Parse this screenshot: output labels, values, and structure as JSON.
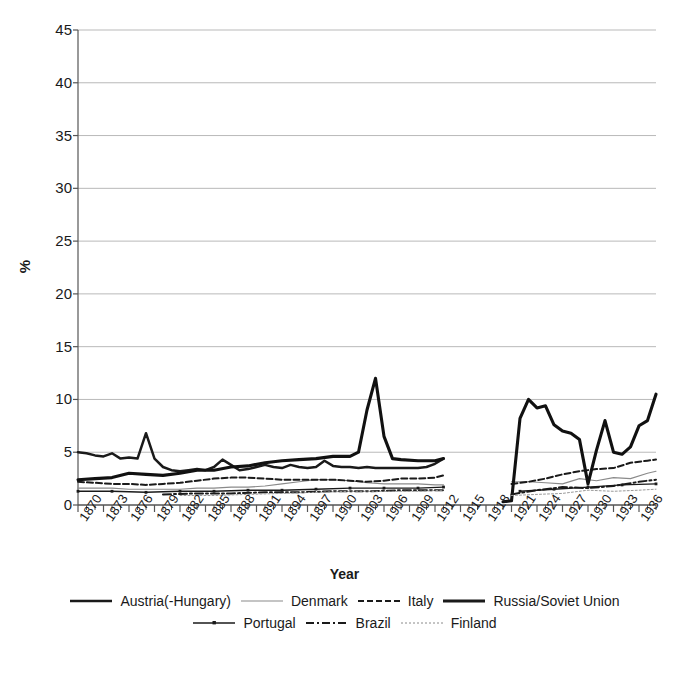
{
  "chart_data": {
    "type": "line",
    "title": "",
    "xlabel": "Year",
    "ylabel": "%",
    "ylim": [
      0,
      45
    ],
    "ytick_step": 5,
    "yticks": [
      45,
      40,
      35,
      30,
      25,
      20,
      15,
      10,
      5,
      0
    ],
    "xlim": [
      1870,
      1938
    ],
    "xtick_labels": [
      "1870",
      "1873",
      "1876",
      "1879",
      "1882",
      "1885",
      "1888",
      "1891",
      "1894",
      "1897",
      "1900",
      "1903",
      "1906",
      "1909",
      "1912",
      "1915",
      "1918",
      "1921",
      "1924",
      "1927",
      "1930",
      "1933",
      "1936"
    ],
    "xtick_step": 3,
    "minor_xtick_step": 1,
    "grid": "horizontal",
    "legend_position": "bottom",
    "series": [
      {
        "name": "Austria(-Hungary)",
        "style": "solid-thick",
        "color": "#1a1a1a",
        "x": [
          1870,
          1871,
          1872,
          1873,
          1874,
          1875,
          1876,
          1877,
          1878,
          1879,
          1880,
          1881,
          1882,
          1883,
          1884,
          1885,
          1886,
          1887,
          1888,
          1889,
          1890,
          1891,
          1892,
          1893,
          1894,
          1895,
          1896,
          1897,
          1898,
          1899,
          1900,
          1901,
          1902,
          1903,
          1904,
          1905,
          1906,
          1907,
          1908,
          1909,
          1910,
          1911,
          1912,
          1913
        ],
        "values": [
          5.0,
          4.9,
          4.7,
          4.6,
          4.9,
          4.4,
          4.5,
          4.4,
          6.8,
          4.4,
          3.6,
          3.3,
          3.2,
          3.3,
          3.4,
          3.3,
          3.6,
          4.3,
          3.8,
          3.3,
          3.4,
          3.6,
          3.8,
          3.6,
          3.5,
          3.8,
          3.6,
          3.5,
          3.6,
          4.2,
          3.7,
          3.6,
          3.6,
          3.5,
          3.6,
          3.5,
          3.5,
          3.5,
          3.5,
          3.5,
          3.5,
          3.6,
          3.9,
          4.4
        ]
      },
      {
        "name": "Denmark",
        "style": "solid-thin",
        "color": "#8a8a8a",
        "x": [
          1870,
          1872,
          1874,
          1876,
          1878,
          1880,
          1882,
          1884,
          1886,
          1888,
          1890,
          1892,
          1894,
          1896,
          1898,
          1900,
          1902,
          1904,
          1906,
          1908,
          1910,
          1912,
          1913,
          1921,
          1923,
          1925,
          1927,
          1929,
          1931,
          1933,
          1935,
          1937,
          1938
        ],
        "values": [
          1.6,
          1.6,
          1.6,
          1.5,
          1.5,
          1.5,
          1.5,
          1.6,
          1.6,
          1.7,
          1.7,
          1.8,
          2.0,
          2.2,
          2.4,
          2.4,
          2.3,
          2.1,
          2.0,
          2.0,
          2.0,
          1.9,
          1.9,
          2.2,
          2.2,
          2.1,
          2.0,
          2.5,
          2.3,
          2.6,
          2.5,
          3.0,
          3.2
        ]
      },
      {
        "name": "Italy",
        "style": "dashed",
        "color": "#1a1a1a",
        "x": [
          1870,
          1872,
          1874,
          1876,
          1878,
          1880,
          1882,
          1884,
          1886,
          1888,
          1890,
          1892,
          1894,
          1896,
          1898,
          1900,
          1902,
          1904,
          1906,
          1908,
          1910,
          1912,
          1913,
          1921,
          1923,
          1925,
          1927,
          1929,
          1931,
          1933,
          1935,
          1937,
          1938
        ],
        "values": [
          2.2,
          2.1,
          2.0,
          2.0,
          1.9,
          2.0,
          2.1,
          2.3,
          2.5,
          2.6,
          2.6,
          2.5,
          2.4,
          2.4,
          2.4,
          2.4,
          2.3,
          2.2,
          2.3,
          2.5,
          2.5,
          2.6,
          2.8,
          2.0,
          2.2,
          2.5,
          2.9,
          3.2,
          3.4,
          3.5,
          4.0,
          4.2,
          4.3
        ]
      },
      {
        "name": "Russia/Soviet Union",
        "style": "solid-extrathick",
        "color": "#111111",
        "x": [
          1870,
          1872,
          1874,
          1876,
          1878,
          1880,
          1882,
          1884,
          1886,
          1888,
          1890,
          1892,
          1894,
          1896,
          1898,
          1900,
          1902,
          1903,
          1904,
          1905,
          1906,
          1907,
          1908,
          1910,
          1912,
          1913,
          1920,
          1921,
          1922,
          1923,
          1924,
          1925,
          1926,
          1927,
          1928,
          1929,
          1930,
          1931,
          1932,
          1933,
          1934,
          1935,
          1936,
          1937,
          1938
        ],
        "values": [
          2.4,
          2.5,
          2.6,
          3.0,
          2.9,
          2.8,
          3.0,
          3.3,
          3.3,
          3.6,
          3.7,
          4.0,
          4.2,
          4.3,
          4.4,
          4.6,
          4.6,
          5.0,
          9.0,
          12.0,
          6.5,
          4.4,
          4.3,
          4.2,
          4.2,
          4.4,
          0.3,
          0.4,
          8.2,
          10.0,
          9.2,
          9.4,
          7.6,
          7.0,
          6.8,
          6.2,
          2.0,
          5.2,
          8.0,
          5.0,
          4.8,
          5.5,
          7.5,
          8.0,
          10.5
        ]
      },
      {
        "name": "Portugal",
        "style": "solid-marker",
        "color": "#1a1a1a",
        "x": [
          1870,
          1874,
          1878,
          1882,
          1886,
          1890,
          1894,
          1898,
          1902,
          1906,
          1910,
          1913,
          1922,
          1926,
          1930,
          1934,
          1938
        ],
        "values": [
          1.3,
          1.3,
          1.2,
          1.3,
          1.3,
          1.4,
          1.4,
          1.5,
          1.6,
          1.6,
          1.6,
          1.7,
          1.3,
          1.5,
          1.7,
          1.9,
          2.0
        ]
      },
      {
        "name": "Brazil",
        "style": "dash-dot",
        "color": "#1a1a1a",
        "x": [
          1880,
          1884,
          1888,
          1892,
          1896,
          1900,
          1904,
          1908,
          1912,
          1913,
          1921,
          1924,
          1927,
          1930,
          1933,
          1936,
          1938
        ],
        "values": [
          1.0,
          1.1,
          1.1,
          1.2,
          1.2,
          1.3,
          1.3,
          1.4,
          1.4,
          1.4,
          1.0,
          1.4,
          1.7,
          1.6,
          1.8,
          2.2,
          2.4
        ]
      },
      {
        "name": "Finland",
        "style": "dotted-thin",
        "color": "#9a9a9a",
        "x": [
          1882,
          1886,
          1890,
          1894,
          1898,
          1902,
          1906,
          1910,
          1913,
          1921,
          1924,
          1927,
          1930,
          1933,
          1936,
          1938
        ],
        "values": [
          0.9,
          0.9,
          1.0,
          1.1,
          1.2,
          1.3,
          1.3,
          1.3,
          1.4,
          0.9,
          1.0,
          1.1,
          1.4,
          1.3,
          1.4,
          1.5
        ]
      }
    ]
  },
  "legend": {
    "rows": [
      [
        {
          "label": "Austria(-Hungary)",
          "style": "solid-thick"
        },
        {
          "label": "Denmark",
          "style": "solid-thin"
        },
        {
          "label": "Italy",
          "style": "dashed"
        },
        {
          "label": "Russia/Soviet Union",
          "style": "solid-extrathick"
        }
      ],
      [
        {
          "label": "Portugal",
          "style": "solid-marker"
        },
        {
          "label": "Brazil",
          "style": "dash-dot"
        },
        {
          "label": "Finland",
          "style": "dotted-thin"
        }
      ]
    ]
  }
}
